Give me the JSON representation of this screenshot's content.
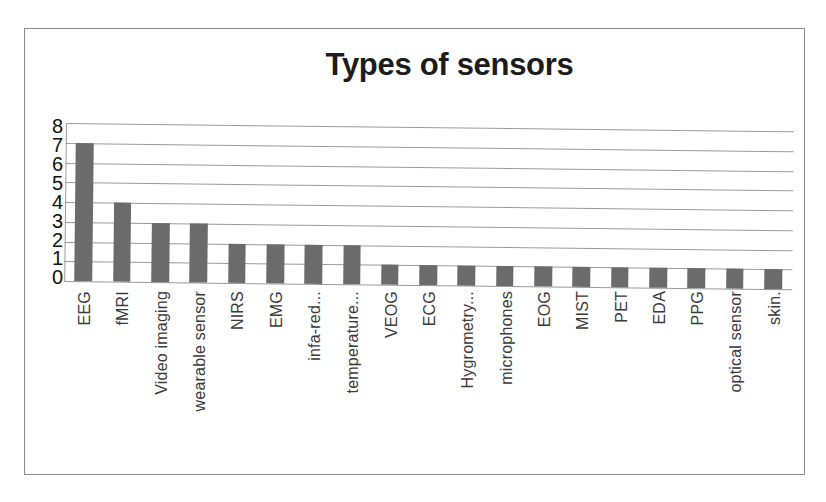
{
  "chart_data": {
    "type": "bar",
    "title": "Types of sensors",
    "xlabel": "",
    "ylabel": "",
    "ylim": [
      0,
      8
    ],
    "ytick_labels": [
      "8",
      "7",
      "6",
      "5",
      "4",
      "3",
      "2",
      "1",
      "0"
    ],
    "grid": true,
    "legend": "none",
    "orientation": "vertical",
    "bar_color": "#6b6b6b",
    "categories": [
      "EEG",
      "fMRI",
      "Video imaging",
      "wearable sensor",
      "NIRS",
      "EMG",
      "infa-red...",
      "temperature...",
      "VEOG",
      "ECG",
      "Hygrometry...",
      "microphones",
      "EOG",
      "MIST",
      "PET",
      "EDA",
      "PPG",
      "optical sensor",
      "skin."
    ],
    "values": [
      7,
      4,
      3,
      3,
      2,
      2,
      2,
      2,
      1,
      1,
      1,
      1,
      1,
      1,
      1,
      1,
      1,
      1,
      1
    ]
  }
}
